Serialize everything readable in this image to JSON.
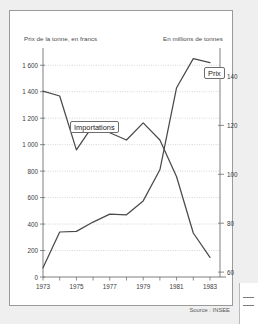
{
  "figure": {
    "left_axis_caption": "Prix de la tonne, en francs",
    "right_axis_caption": "En millions de tonnes",
    "source_note": "Source : INSEE"
  },
  "labels": {
    "importations_tag": "Importations",
    "prix_tag": "Prix"
  },
  "chart_data": {
    "type": "line",
    "title": "",
    "xlabel": "",
    "ylabel": "Prix de la tonne, en francs",
    "y2label": "En millions de tonnes",
    "grid": true,
    "legend_position": "inline-annotations",
    "x": [
      1973,
      1974,
      1975,
      1976,
      1977,
      1978,
      1979,
      1980,
      1981,
      1982,
      1983
    ],
    "x_tick_labels": [
      "1973",
      "1975",
      "1977",
      "1979",
      "1981",
      "1983"
    ],
    "x_tick_values": [
      1973,
      1975,
      1977,
      1979,
      1981,
      1983
    ],
    "xlim": [
      1973,
      1983.6
    ],
    "ylim": [
      0,
      1700
    ],
    "y_tick_labels": [
      "0",
      "200",
      "400",
      "600",
      "800",
      "1 000",
      "1 200",
      "1 400",
      "1 600"
    ],
    "y_tick_values": [
      0,
      200,
      400,
      600,
      800,
      1000,
      1200,
      1400,
      1600
    ],
    "y2lim": [
      58,
      150
    ],
    "y2_tick_labels": [
      "60",
      "80",
      "100",
      "120",
      "140"
    ],
    "y2_tick_values": [
      60,
      80,
      100,
      120,
      140
    ],
    "series": [
      {
        "name": "Prix",
        "axis": "left",
        "unit": "francs par tonne",
        "values": [
          70,
          340,
          345,
          415,
          475,
          470,
          575,
          810,
          1430,
          1650,
          1620
        ]
      },
      {
        "name": "Importations",
        "axis": "right",
        "unit": "millions de tonnes",
        "values": [
          134,
          132,
          110,
          120,
          117,
          114,
          121,
          114,
          99,
          76,
          66
        ]
      }
    ],
    "annotations": [
      {
        "text": "Importations",
        "series": "Importations"
      },
      {
        "text": "Prix",
        "series": "Prix"
      }
    ]
  },
  "colors": {
    "line": "#4a4a4a",
    "grid": "#b8b8b8",
    "axis": "#6f6f6f",
    "card_background": "#ffffff",
    "page_background": "#efefef"
  }
}
